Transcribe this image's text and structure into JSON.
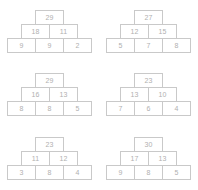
{
  "worksheet": {
    "title": "Number Pyramid Worksheet",
    "colors": {
      "border": "#c9c9c9",
      "text": "#b0b0b0",
      "background": "#ffffff"
    },
    "pyramids": [
      {
        "name": "pyramid-1",
        "rows": [
          [
            "29"
          ],
          [
            "18",
            "11"
          ],
          [
            "9",
            "9",
            "2"
          ]
        ]
      },
      {
        "name": "pyramid-2",
        "rows": [
          [
            "27"
          ],
          [
            "12",
            "15"
          ],
          [
            "5",
            "7",
            "8"
          ]
        ]
      },
      {
        "name": "pyramid-3",
        "rows": [
          [
            "29"
          ],
          [
            "16",
            "13"
          ],
          [
            "8",
            "8",
            "5"
          ]
        ]
      },
      {
        "name": "pyramid-4",
        "rows": [
          [
            "23"
          ],
          [
            "13",
            "10"
          ],
          [
            "7",
            "6",
            "4"
          ]
        ]
      },
      {
        "name": "pyramid-5",
        "rows": [
          [
            "23"
          ],
          [
            "11",
            "12"
          ],
          [
            "3",
            "8",
            "4"
          ]
        ]
      },
      {
        "name": "pyramid-6",
        "rows": [
          [
            "30"
          ],
          [
            "17",
            "13"
          ],
          [
            "9",
            "8",
            "5"
          ]
        ]
      }
    ]
  }
}
